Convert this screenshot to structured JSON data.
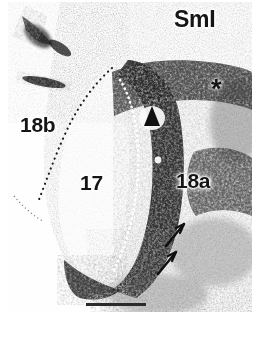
{
  "figure": {
    "kind": "brain-section-autoradiograph",
    "modality": "darkfield autoradiograph of cortical section",
    "background_color": "#ffffff",
    "ink_color": "#151515",
    "panel": {
      "x": 8,
      "y": 2,
      "width": 244,
      "height": 310
    }
  },
  "labels": {
    "smi": "SmI",
    "area_18b": "18b",
    "area_17": "17",
    "area_18a": "18a"
  },
  "markers": {
    "asterisk": "*",
    "arrowhead": "filled-triangle-up",
    "arrow_count": 2
  },
  "annotations": [
    {
      "name": "label-smi",
      "text": "SmI",
      "x": 166,
      "y": 6,
      "role": "cortical-field-label"
    },
    {
      "name": "label-18b",
      "text": "18b",
      "x": 12,
      "y": 112,
      "role": "cortical-area-label"
    },
    {
      "name": "label-17",
      "text": "17",
      "x": 72,
      "y": 170,
      "role": "cortical-area-label"
    },
    {
      "name": "label-18a",
      "text": "18a",
      "x": 168,
      "y": 168,
      "role": "cortical-area-label"
    },
    {
      "name": "asterisk-marker",
      "text": "*",
      "x": 203,
      "y": 74,
      "role": "region-of-interest-marker"
    },
    {
      "name": "arrowhead-marker",
      "text": "",
      "x": 144,
      "y": 112,
      "role": "points-to-dense-label-band"
    },
    {
      "name": "arrow-upper",
      "text": "",
      "x": 168,
      "y": 228,
      "role": "points-to-patchy-label"
    },
    {
      "name": "arrow-lower",
      "text": "",
      "x": 160,
      "y": 256,
      "role": "points-to-patchy-label"
    }
  ],
  "boundaries": [
    {
      "name": "border-17-18b",
      "style": "black-dotted",
      "role": "areal-border between 17 and 18b"
    },
    {
      "name": "border-17-18a",
      "style": "white-dotted",
      "role": "areal-border between 17 and 18a"
    }
  ],
  "scale_bar": {
    "label": "",
    "x": 78,
    "y": 301,
    "width": 60,
    "height": 3,
    "color": "#2a2a2a"
  },
  "caption": {
    "text": ""
  }
}
